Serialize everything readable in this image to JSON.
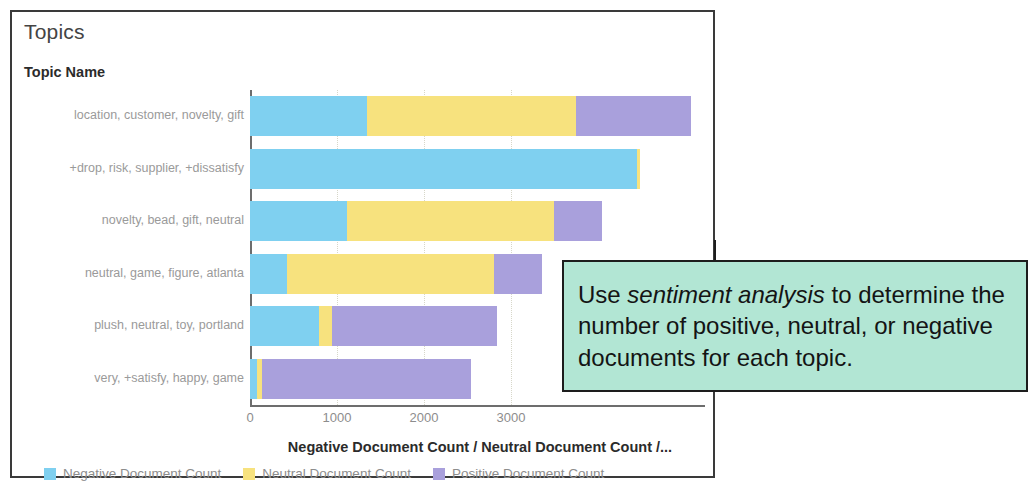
{
  "panel": {
    "title": "Topics",
    "column_header": "Topic Name"
  },
  "callout": {
    "text_before": "Use ",
    "text_emphasis": "sentiment analysis",
    "text_after": " to determine the number of positive, neutral, or negative documents for each topic."
  },
  "axis": {
    "x_title": "Negative Document Count / Neutral Document Count /...",
    "ticks": [
      "0",
      "1000",
      "2000",
      "3000"
    ]
  },
  "legend": {
    "items": [
      {
        "label": "Negative Document Count",
        "color": "#7fd0f0"
      },
      {
        "label": "Neutral Document Count",
        "color": "#f7e27e"
      },
      {
        "label": "Positive Document Count",
        "color": "#a9a0dc"
      }
    ]
  },
  "chart_data": {
    "type": "bar",
    "orientation": "horizontal",
    "stacked": true,
    "title": "Topics",
    "xlabel": "Negative Document Count / Neutral Document Count /...",
    "ylabel": "Topic Name",
    "xlim": [
      0,
      5230
    ],
    "xticks": [
      0,
      1000,
      2000,
      3000
    ],
    "grid": true,
    "legend_position": "bottom-left",
    "categories": [
      "location, customer, novelty, gift",
      "+drop, risk, supplier, +dissatisfy",
      "novelty, bead, gift, neutral",
      "neutral, game, figure, atlanta",
      "plush, neutral, toy, portland",
      "very, +satisfy, happy, game"
    ],
    "series": [
      {
        "name": "Negative Document Count",
        "color": "#7fd0f0",
        "values": [
          1350,
          4450,
          1120,
          430,
          790,
          80
        ]
      },
      {
        "name": "Neutral Document Count",
        "color": "#f7e27e",
        "values": [
          2400,
          30,
          2380,
          2380,
          150,
          60
        ]
      },
      {
        "name": "Positive Document Count",
        "color": "#a9a0dc",
        "values": [
          1320,
          0,
          550,
          550,
          1900,
          2400
        ]
      }
    ],
    "totals": [
      5070,
      4480,
      4050,
      3360,
      2840,
      2540
    ]
  }
}
